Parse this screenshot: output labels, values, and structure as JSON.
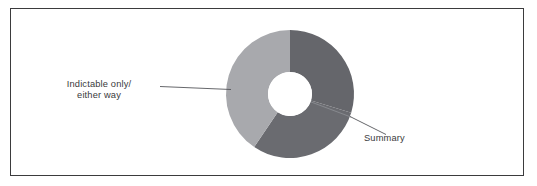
{
  "figure": {
    "background_color": "#ffffff",
    "frame_color": "#3b3b3d"
  },
  "chart_data": {
    "type": "pie",
    "variant": "donut",
    "title": "",
    "subtitle": "",
    "xlabel": "",
    "ylabel": "",
    "legend_position": "none",
    "grid": false,
    "label_style": "leader-line callouts",
    "center": [
      290,
      94
    ],
    "outer_radius": 64,
    "inner_radius": 22,
    "start_angle_deg": 0,
    "direction": "clockwise",
    "categories": [
      "Summary",
      "Summary",
      "Indictable only/either way"
    ],
    "values": [
      30,
      30,
      40
    ],
    "slices": [
      {
        "label": "Summary",
        "value": 30,
        "start_angle_deg": 0,
        "end_angle_deg": 107,
        "color": "#65666b"
      },
      {
        "label": "Summary",
        "value": 30,
        "start_angle_deg": 107,
        "end_angle_deg": 214,
        "color": "#6a6b70"
      },
      {
        "label": "Indictable only/either way",
        "value": 40,
        "start_angle_deg": 214,
        "end_angle_deg": 360,
        "color": "#a8a9ad"
      }
    ],
    "annotations": [
      {
        "name": "indictable-callout",
        "line1": "Indictable only/",
        "line2": "either way",
        "leader_from": [
          160,
          86
        ],
        "leader_to": [
          231,
          90
        ]
      },
      {
        "name": "summary-callout",
        "line1": "Summary",
        "leader_from": [
          350,
          117
        ],
        "leader_to": [
          386,
          135
        ]
      }
    ]
  },
  "labels": {
    "indictable_line1": "Indictable only/",
    "indictable_line2": "either way",
    "summary": "Summary"
  }
}
